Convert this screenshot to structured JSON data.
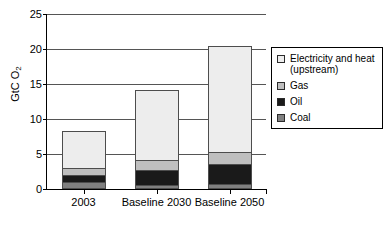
{
  "chart_data": {
    "type": "bar",
    "stacked": true,
    "title": "",
    "xlabel": "",
    "ylabel": "GtC O2",
    "ylabel_main": "GtC O",
    "ylabel_sub": "2",
    "categories": [
      "2003",
      "Baseline 2030",
      "Baseline 2050"
    ],
    "ylim": [
      0,
      25
    ],
    "yticks": [
      0,
      5,
      10,
      15,
      20,
      25
    ],
    "grid": true,
    "legend_position": "right",
    "series": [
      {
        "name": "Coal",
        "color": "#808080",
        "values": [
          1.0,
          0.6,
          0.7
        ]
      },
      {
        "name": "Oil",
        "color": "#1a1a1a",
        "values": [
          1.1,
          2.3,
          3.0
        ]
      },
      {
        "name": "Gas",
        "color": "#bfbfbf",
        "values": [
          1.2,
          1.6,
          1.9
        ]
      },
      {
        "name": "Electricity and heat (upstream)",
        "color": "#ededed",
        "values": [
          5.4,
          10.1,
          15.2
        ]
      }
    ],
    "totals": [
      8.7,
      14.6,
      20.8
    ]
  },
  "legend": {
    "items": [
      {
        "label_line1": "Electricity and heat",
        "label_line2": "(upstream)",
        "color": "#ededed"
      },
      {
        "label_line1": "Gas",
        "label_line2": "",
        "color": "#bfbfbf"
      },
      {
        "label_line1": "Oil",
        "label_line2": "",
        "color": "#1a1a1a"
      },
      {
        "label_line1": "Coal",
        "label_line2": "",
        "color": "#808080"
      }
    ]
  },
  "caption": {
    "text": ""
  }
}
